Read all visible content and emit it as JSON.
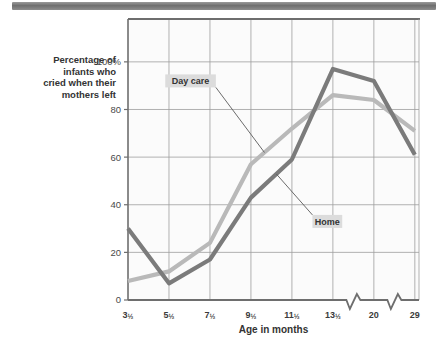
{
  "figure": {
    "header_strip": "decorative-dark-bar",
    "y_axis_title_lines": [
      "Percentage of",
      "infants who",
      "cried when their",
      "mothers left"
    ]
  },
  "chart_data": {
    "type": "line",
    "title": "",
    "xlabel": "Age in months",
    "ylabel": "Percentage of infants who cried when their mothers left",
    "categories": [
      "3½",
      "5½",
      "7½",
      "9½",
      "11½",
      "13½",
      "20",
      "29"
    ],
    "ytick_labels": [
      "0",
      "20",
      "40",
      "60",
      "80",
      "100%"
    ],
    "ytick_values": [
      0,
      20,
      40,
      60,
      80,
      100
    ],
    "ylim": [
      0,
      118
    ],
    "grid": true,
    "legend_position": "inline-annotations",
    "axis_breaks": [
      "between 13½ and 20",
      "between 20 and 29"
    ],
    "series": [
      {
        "name": "Day care",
        "color": "#b9b9b9",
        "values": [
          8,
          12,
          24,
          57,
          72,
          86,
          84,
          71
        ],
        "label_x_frac": 0.215,
        "label_y_pct": 92
      },
      {
        "name": "Home",
        "color": "#7b7b7b",
        "values": [
          30,
          7,
          17,
          43,
          59,
          97,
          92,
          61
        ],
        "label_x_frac": 0.685,
        "label_y_pct": 33
      }
    ]
  }
}
